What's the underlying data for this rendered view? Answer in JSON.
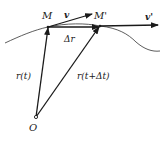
{
  "diagram": {
    "colors": {
      "ink": "#1a1a1a",
      "background": "#ffffff"
    },
    "points": {
      "origin": {
        "label": "O",
        "x": 36,
        "y": 117
      },
      "M": {
        "label": "M",
        "x": 48,
        "y": 27
      },
      "M_prime": {
        "label": "M'",
        "x": 100,
        "y": 26
      }
    },
    "vectors": {
      "r_t": {
        "label": "r(t)",
        "from": "O",
        "to": "M"
      },
      "r_t_dt": {
        "label": "r(t+Δt)",
        "from": "O",
        "to": "M'"
      },
      "delta_r": {
        "label": "Δr",
        "from": "M",
        "to": "M'"
      },
      "v": {
        "label": "v",
        "from": "M"
      },
      "v_prime": {
        "label": "v'",
        "from": "M'"
      }
    },
    "labels": {
      "M": "M",
      "M_prime": "M'",
      "v": "v",
      "v_prime": "v'",
      "delta_r": "Δr",
      "r_t": "r(t)",
      "r_t_dt": "r(t+Δt)",
      "O": "O"
    }
  }
}
